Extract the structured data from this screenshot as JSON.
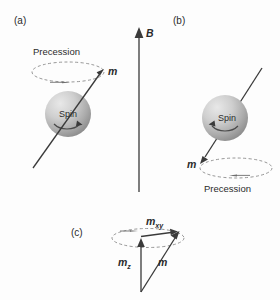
{
  "figure": {
    "background_color": "#fdfdfd",
    "ink_color": "#3a3a3a",
    "dash_color": "#8a8a8a",
    "field_label": "B",
    "panels": [
      {
        "id": "a",
        "label": "(a)",
        "precession_label": "Precession",
        "sphere_label": "Spin",
        "moment_label": "m",
        "moment_direction": "up-right",
        "precession_arrow_direction": "right"
      },
      {
        "id": "b",
        "label": "(b)",
        "precession_label": "Precession",
        "sphere_label": "Spin",
        "moment_label": "m",
        "moment_direction": "down-left",
        "precession_arrow_direction": "left"
      },
      {
        "id": "c",
        "label": "(c)",
        "vectors": [
          {
            "name": "m-xy",
            "base": "m",
            "sub": "xy"
          },
          {
            "name": "m-z",
            "base": "m",
            "sub": "z"
          },
          {
            "name": "m",
            "base": "m",
            "sub": ""
          }
        ]
      }
    ]
  }
}
